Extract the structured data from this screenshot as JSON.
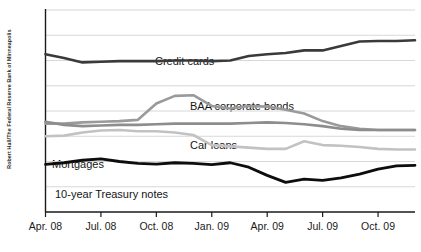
{
  "credit": {
    "text": "Robert Hall/The Federal Reserve Bank of Minneapolis"
  },
  "chart_data": {
    "type": "line",
    "title": "",
    "subtitle": "",
    "xlabel": "",
    "ylabel": "",
    "ylim": [
      0,
      16
    ],
    "grid": true,
    "legend_position": "inline-labels",
    "ytick_labels": [
      "16%",
      "14",
      "12",
      "10",
      "8",
      "6",
      "4",
      "2",
      "0"
    ],
    "ytick_values": [
      16,
      14,
      12,
      10,
      8,
      6,
      4,
      2,
      0
    ],
    "xtick_labels": [
      "Apr. 08",
      "Jul. 08",
      "Oct. 08",
      "Jan. 09",
      "Apr. 09",
      "Jul. 09",
      "Oct. 09"
    ],
    "xtick_values": [
      0,
      3,
      6,
      9,
      12,
      15,
      18
    ],
    "x": [
      0,
      1,
      2,
      3,
      4,
      5,
      6,
      7,
      8,
      9,
      10,
      11,
      12,
      13,
      14,
      15,
      16,
      17,
      18,
      19,
      20
    ],
    "x_months": [
      "Apr. 08",
      "May 08",
      "Jun. 08",
      "Jul. 08",
      "Aug. 08",
      "Sep. 08",
      "Oct. 08",
      "Nov. 08",
      "Dec. 08",
      "Jan. 09",
      "Feb. 09",
      "Mar. 09",
      "Apr. 09",
      "May 09",
      "Jun. 09",
      "Jul. 09",
      "Aug. 09",
      "Sep. 09",
      "Oct. 09",
      "Nov. 09",
      "Dec. 09"
    ],
    "series": [
      {
        "name": "Credit cards",
        "color": "#3a3a3a",
        "width": 2.6,
        "label_x": 155,
        "label_y": 55,
        "values": [
          12.5,
          12.2,
          11.85,
          11.9,
          11.95,
          11.95,
          11.95,
          12.0,
          12.0,
          11.95,
          12.0,
          12.35,
          12.5,
          12.6,
          12.8,
          12.8,
          13.15,
          13.5,
          13.55,
          13.55,
          13.6
        ]
      },
      {
        "name": "BAA corporate bonds",
        "color": "#9a9a9a",
        "width": 2.6,
        "label_x": 190,
        "label_y": 100,
        "values": [
          7.0,
          7.0,
          7.1,
          7.15,
          7.2,
          7.3,
          8.6,
          9.2,
          9.25,
          8.4,
          8.2,
          8.4,
          8.35,
          8.1,
          7.8,
          7.2,
          6.8,
          6.6,
          6.5,
          6.5,
          6.5
        ]
      },
      {
        "name": "Car loans",
        "color": "#8d8d8d",
        "width": 2.6,
        "label_x": 190,
        "label_y": 139,
        "values": [
          7.15,
          6.9,
          6.8,
          6.85,
          6.9,
          6.9,
          6.95,
          7.0,
          7.0,
          7.0,
          7.0,
          7.05,
          7.1,
          7.05,
          6.95,
          6.8,
          6.6,
          6.5,
          6.5,
          6.5,
          6.5
        ]
      },
      {
        "name": "Mortgages",
        "color": "#c2c2c2",
        "width": 2.6,
        "label_x": 52,
        "label_y": 158,
        "values": [
          6.0,
          6.05,
          6.3,
          6.45,
          6.5,
          6.4,
          6.4,
          6.3,
          6.1,
          5.3,
          5.2,
          5.1,
          5.0,
          5.0,
          5.6,
          5.3,
          5.25,
          5.15,
          5.0,
          4.95,
          4.95
        ]
      },
      {
        "name": "10-year Treasury notes",
        "color": "#0d0d0d",
        "width": 2.8,
        "label_x": 55,
        "label_y": 188,
        "values": [
          3.78,
          3.9,
          4.1,
          4.2,
          4.0,
          3.85,
          3.8,
          3.9,
          3.85,
          3.75,
          3.9,
          3.55,
          2.9,
          2.35,
          2.6,
          2.5,
          2.7,
          3.0,
          3.4,
          3.65,
          3.7
        ]
      }
    ],
    "extra_points": {
      "treasury_tail": [
        3.6,
        3.55,
        3.55,
        3.6,
        3.65,
        3.8
      ]
    }
  }
}
